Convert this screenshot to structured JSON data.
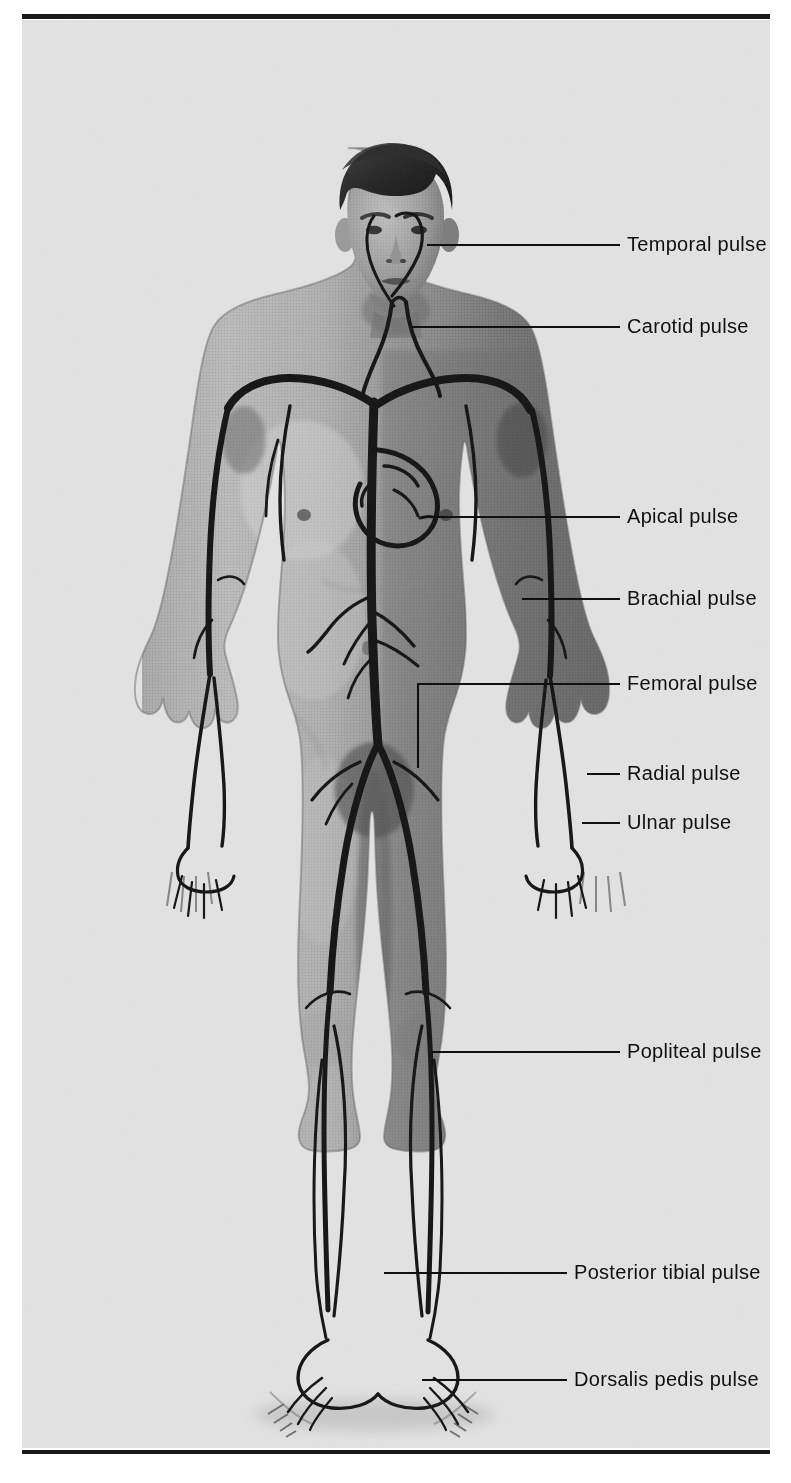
{
  "figure": {
    "caption": "This illustration shows the locations of the major peripheral arterial pulses and the apical pulse.",
    "illustration_alt": "Anterior view photograph of a standing adult male with the major arterial tree drawn over the body",
    "background_color": "#e3e3e3",
    "rule_color": "#1a1a1a",
    "text_color": "#101010"
  },
  "callouts": [
    {
      "id": "temporal",
      "label": "Temporal pulse",
      "line_y": 224,
      "line_x1": 405,
      "line_x2": 598,
      "text_x": 605,
      "text_y": 214
    },
    {
      "id": "carotid",
      "label": "Carotid pulse",
      "line_y": 306,
      "line_x1": 389,
      "line_x2": 598,
      "text_x": 605,
      "text_y": 296
    },
    {
      "id": "apical",
      "label": "Apical pulse",
      "line_y": 496,
      "line_x1": 400,
      "line_x2": 598,
      "text_x": 605,
      "text_y": 486
    },
    {
      "id": "brachial",
      "label": "Brachial pulse",
      "line_y": 578,
      "line_x1": 500,
      "line_x2": 598,
      "text_x": 605,
      "text_y": 568
    },
    {
      "id": "femoral",
      "label": "Femoral pulse",
      "line_y": 663,
      "line_x1": 395,
      "line_x2": 598,
      "text_x": 605,
      "text_y": 653,
      "drop_x": 395,
      "drop_y1": 663,
      "drop_y2": 748
    },
    {
      "id": "radial",
      "label": "Radial pulse",
      "line_y": 753,
      "line_x1": 565,
      "line_x2": 598,
      "text_x": 605,
      "text_y": 743
    },
    {
      "id": "ulnar",
      "label": "Ulnar pulse",
      "line_y": 802,
      "line_x1": 560,
      "line_x2": 598,
      "text_x": 605,
      "text_y": 792
    },
    {
      "id": "popliteal",
      "label": "Popliteal pulse",
      "line_y": 1031,
      "line_x1": 410,
      "line_x2": 598,
      "text_x": 605,
      "text_y": 1021
    },
    {
      "id": "posterior-tibial",
      "label": "Posterior tibial pulse",
      "line_y": 1252,
      "line_x1": 362,
      "line_x2": 545,
      "text_x": 552,
      "text_y": 1242
    },
    {
      "id": "dorsalis-pedis",
      "label": "Dorsalis pedis pulse",
      "line_y": 1359,
      "line_x1": 400,
      "line_x2": 545,
      "text_x": 552,
      "text_y": 1349
    }
  ]
}
